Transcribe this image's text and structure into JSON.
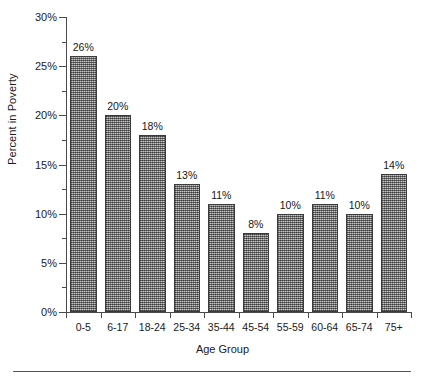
{
  "chart_data": {
    "type": "bar",
    "title": "",
    "subtitle": "",
    "xlabel": "Age Group",
    "ylabel": "Percent in Poverty",
    "categories": [
      "0-5",
      "6-17",
      "18-24",
      "25-34",
      "35-44",
      "45-54",
      "55-59",
      "60-64",
      "65-74",
      "75+"
    ],
    "values": [
      26,
      20,
      18,
      13,
      11,
      8,
      10,
      11,
      10,
      14
    ],
    "value_labels": [
      "26%",
      "20%",
      "18%",
      "13%",
      "11%",
      "8%",
      "10%",
      "11%",
      "10%",
      "14%"
    ],
    "ylim": [
      0,
      30
    ],
    "ytick_values": [
      0,
      5,
      10,
      15,
      20,
      25,
      30
    ],
    "ytick_labels": [
      "0%",
      "5%",
      "10%",
      "15%",
      "20%",
      "25%",
      "30%"
    ],
    "yminor_tick_values": [
      2.5,
      7.5,
      12.5,
      17.5,
      22.5,
      27.5
    ],
    "grid": false,
    "legend": null,
    "legend_position": "none",
    "bar_fill_color": "#8c8c8c",
    "bar_edge_color": "#3b3b3b",
    "axis_color": "#4a4a4a",
    "text_color": "#1a1a1a"
  },
  "figure": {
    "footer_rule_color": "#555555"
  }
}
